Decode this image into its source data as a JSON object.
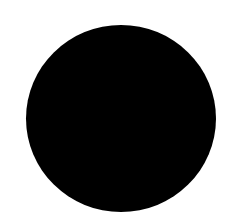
{
  "canvas": {
    "width": 236,
    "height": 224,
    "background": "#ffffff"
  },
  "shapes": [
    {
      "type": "circle",
      "fill": "#000000",
      "bounds": {
        "left": 26,
        "top": 25,
        "width": 190,
        "height": 187
      }
    }
  ]
}
